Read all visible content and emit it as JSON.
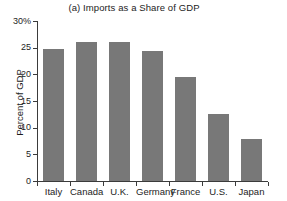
{
  "chart_data": {
    "type": "bar",
    "title": "(a) Imports as a Share of GDP",
    "xlabel": "",
    "ylabel": "Percent of GDP",
    "categories": [
      "Italy",
      "Canada",
      "U.K.",
      "Germany",
      "France",
      "U.S.",
      "Japan"
    ],
    "values": [
      24.8,
      26.0,
      26.0,
      24.4,
      19.5,
      12.6,
      7.8
    ],
    "ylim": [
      0,
      30
    ],
    "yticks": [
      0,
      5,
      10,
      15,
      20,
      25,
      30
    ],
    "ytick_labels": [
      "0",
      "5",
      "10",
      "15",
      "20",
      "25",
      "30%"
    ],
    "grid": false,
    "legend": null,
    "bar_color": "#787878",
    "axis_color": "#3b3b3b",
    "background_color": "#ffffff"
  },
  "neighbor_panel": {
    "ylabel": "Percent of GDP"
  }
}
